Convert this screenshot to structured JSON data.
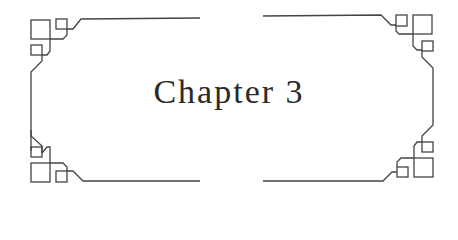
{
  "heading": {
    "title": "Chapter 3"
  },
  "ornament": {
    "stroke_color": "#444444",
    "background_color": "#ffffff",
    "style": "art-deco bracket frame with square corner motifs"
  }
}
